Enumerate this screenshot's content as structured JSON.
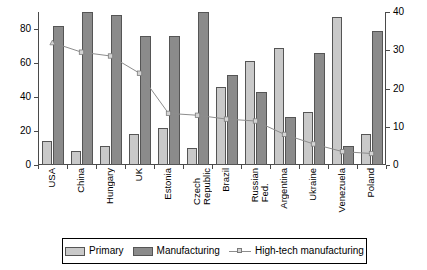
{
  "chart_data": {
    "type": "bar",
    "title": "",
    "subtitle": "",
    "xlabel": "",
    "ylabel": "",
    "grid": false,
    "legend_position": "bottom",
    "categories": [
      "USA",
      "China",
      "Hungary",
      "UK",
      "Estonia",
      "Czech\nRepublic",
      "Brazil",
      "Russian\nFed.",
      "Argentina",
      "Ukraine",
      "Venezuela",
      "Poland"
    ],
    "axes": {
      "left": {
        "label": "",
        "min": 0,
        "max": 90,
        "ticks": [
          0,
          20,
          40,
          60,
          80
        ]
      },
      "right": {
        "label": "",
        "min": 0,
        "max": 40,
        "ticks": [
          0,
          10,
          20,
          30,
          40
        ]
      }
    },
    "series": [
      {
        "name": "Primary",
        "axis": "left",
        "type": "bar",
        "color": "#c9c9c9",
        "values": [
          14,
          8,
          11,
          18,
          22,
          10,
          46,
          61,
          69,
          31,
          87,
          18
        ]
      },
      {
        "name": "Manufacturing",
        "axis": "left",
        "type": "bar",
        "color": "#8b8b8b",
        "values": [
          82,
          90,
          88,
          76,
          76,
          90,
          53,
          43,
          28,
          66,
          11,
          79
        ]
      },
      {
        "name": "High-tech manufacturing",
        "axis": "right",
        "type": "line",
        "color": "#8d8d8d",
        "values": [
          32,
          29.5,
          28.5,
          24,
          13.5,
          13,
          12,
          11.5,
          8,
          5.5,
          3.5,
          3
        ]
      }
    ]
  },
  "legend": {
    "items": [
      {
        "label": "Primary",
        "marker": "swatch-light"
      },
      {
        "label": "Manufacturing",
        "marker": "swatch-dark"
      },
      {
        "label": "High-tech manufacturing",
        "marker": "line-marker"
      }
    ]
  }
}
